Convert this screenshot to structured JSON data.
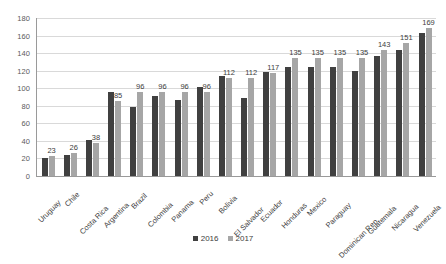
{
  "chart_data": {
    "type": "bar",
    "title": "",
    "subtitle": "",
    "xlabel": "",
    "ylabel": "",
    "ylim": [
      0,
      180
    ],
    "ytick_step": 20,
    "yticks": [
      180,
      160,
      140,
      120,
      100,
      80,
      60,
      40,
      20,
      0
    ],
    "grid": true,
    "legend_position": "bottom",
    "categories": [
      "Uruguay",
      "Chile",
      "Costa Rica",
      "Argentina",
      "Brazil",
      "Colombia",
      "Panama",
      "Peru",
      "Bolivia",
      "El Salvador",
      "Ecuador",
      "Honduras",
      "Mexico",
      "Paraguay",
      "Dominican Rep.",
      "Guatemala",
      "Nicaragua",
      "Venezuela"
    ],
    "series": [
      {
        "name": "2016",
        "color": "#404040",
        "values": [
          21,
          24,
          41,
          96,
          79,
          91,
          87,
          101,
          114,
          89,
          119,
          124,
          124,
          124,
          120,
          137,
          143,
          163
        ],
        "labels": [
          "",
          "",
          "",
          "",
          "",
          "",
          "",
          "",
          "",
          "",
          "",
          "",
          "",
          "",
          "",
          "",
          "",
          ""
        ]
      },
      {
        "name": "2017",
        "color": "#a6a6a6",
        "values": [
          23,
          26,
          38,
          85,
          96,
          96,
          96,
          96,
          112,
          112,
          117,
          135,
          135,
          135,
          135,
          143,
          151,
          169
        ],
        "labels": [
          "23",
          "26",
          "38",
          "85",
          "96",
          "96",
          "96",
          "96",
          "112",
          "112",
          "117",
          "135",
          "135",
          "135",
          "135",
          "143",
          "151",
          "169"
        ]
      }
    ]
  },
  "legend": {
    "items": [
      {
        "label": "2016"
      },
      {
        "label": "2017"
      }
    ]
  }
}
